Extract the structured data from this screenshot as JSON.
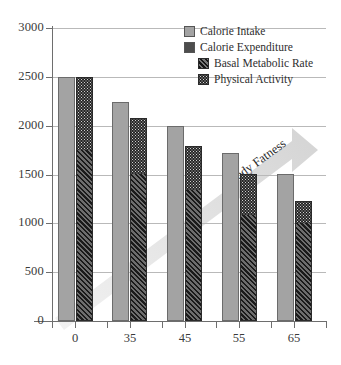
{
  "chart_data": {
    "type": "bar",
    "title": "",
    "subtitle": "",
    "xlabel": "",
    "ylabel": "",
    "categories": [
      "0",
      "35",
      "45",
      "55",
      "65"
    ],
    "ylim": [
      0,
      3000
    ],
    "yticks": [
      0,
      500,
      1000,
      1500,
      2000,
      2500,
      3000
    ],
    "ytick_labels": [
      "0",
      "500",
      "1000",
      "1500",
      "2000",
      "2500",
      "3000"
    ],
    "grid": true,
    "legend_position": "top-right",
    "series": [
      {
        "name": "Calorie Intake",
        "style": "solid-light-gray",
        "color": "#a3a3a3",
        "values": [
          2500,
          2240,
          2000,
          1725,
          1500
        ]
      },
      {
        "name": "Calorie Expenditure",
        "style": "stacked-total",
        "color": "#4d4d4d",
        "values": [
          2500,
          2080,
          1790,
          1500,
          1225
        ]
      },
      {
        "name": "Basal Metabolic Rate",
        "style": "diagonal-hatch",
        "color": "#3b3b3b",
        "stack_of": "Calorie Expenditure",
        "values": [
          1750,
          1500,
          1340,
          1090,
          1000
        ]
      },
      {
        "name": "Physical Activity",
        "style": "dotted",
        "color": "#262626",
        "stack_of": "Calorie Expenditure",
        "values": [
          750,
          580,
          450,
          410,
          225
        ]
      }
    ],
    "annotations": [
      {
        "text": "Body Fatness",
        "type": "arrow",
        "direction": "up-right",
        "color": "#dcdcdc"
      }
    ]
  },
  "legend": {
    "items": [
      {
        "label": "Calorie Intake",
        "swatch": "solid-light-gray-swatch"
      },
      {
        "label": "Calorie Expenditure",
        "swatch": "solid-dark-gray-swatch"
      },
      {
        "label": "Basal Metabolic Rate",
        "swatch": "diagonal-hatch-swatch"
      },
      {
        "label": "Physical Activity",
        "swatch": "dotted-swatch"
      }
    ]
  },
  "annotation": {
    "body_fatness_label": "Body Fatness"
  }
}
